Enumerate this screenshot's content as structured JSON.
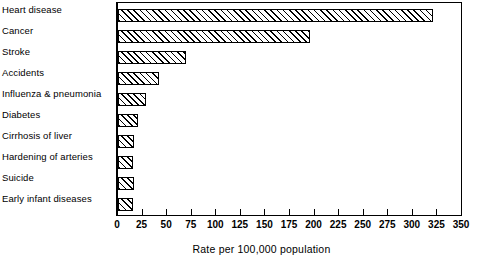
{
  "chart_data": {
    "type": "bar",
    "orientation": "horizontal",
    "title": "",
    "xlabel": "Rate per 100,000 population",
    "ylabel": "",
    "xlim": [
      0,
      350
    ],
    "xticks": [
      0,
      25,
      50,
      75,
      100,
      125,
      150,
      175,
      200,
      225,
      250,
      275,
      300,
      325,
      350
    ],
    "xtick_labels": [
      "0",
      "25",
      "50",
      "75",
      "100",
      "125",
      "150",
      "175",
      "200",
      "225",
      "250",
      "275",
      "300",
      "325",
      "350"
    ],
    "grid": false,
    "legend": false,
    "bar_style": {
      "fill": "#ffffff",
      "hatch": "diagonal-45",
      "edge_color": "#000000"
    },
    "categories": [
      "Heart disease",
      "Cancer",
      "Stroke",
      "Accidents",
      "Influenza & pneumonia",
      "Diabetes",
      "Cirrhosis of liver",
      "Hardening of arteries",
      "Suicide",
      "Early infant diseases"
    ],
    "values": [
      320,
      195,
      69,
      42,
      28,
      20,
      16,
      15,
      16,
      15
    ]
  }
}
